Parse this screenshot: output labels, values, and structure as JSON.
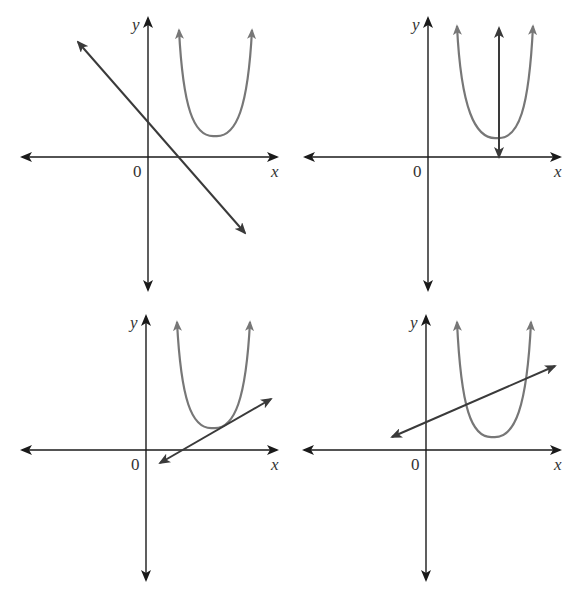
{
  "colors": {
    "axis": "#1a1a1a",
    "line": "#3a3a3a",
    "parabola": "#777777",
    "background": "#ffffff"
  },
  "panels": [
    {
      "id": "top-left",
      "description": "Line with negative slope; no intersection with parabola",
      "axis_labels": {
        "x": "x",
        "y": "y",
        "origin": "0"
      },
      "axes": {
        "ox": 148,
        "oy": 157,
        "x_from": 22,
        "x_to": 277,
        "y_from": 18,
        "y_to": 290
      },
      "parabola": {
        "vx": 215,
        "vy": 136,
        "arm_left_x": 179,
        "arm_right_x": 252,
        "arm_top_y": 30
      },
      "line": {
        "x1": 78,
        "y1": 42,
        "x2": 245,
        "y2": 233
      }
    },
    {
      "id": "top-right",
      "description": "Vertical line x = a passing through vertex region of parabola",
      "axis_labels": {
        "x": "x",
        "y": "y",
        "origin": "0"
      },
      "axes": {
        "ox": 428,
        "oy": 157,
        "x_from": 305,
        "x_to": 560,
        "y_from": 18,
        "y_to": 290
      },
      "parabola": {
        "vx": 497,
        "vy": 138,
        "arm_left_x": 457,
        "arm_right_x": 533,
        "arm_top_y": 26
      },
      "line": {
        "x1": 499,
        "y1": 28,
        "x2": 499,
        "y2": 157
      }
    },
    {
      "id": "bottom-left",
      "description": "Line tangent to parabola near its vertex",
      "axis_labels": {
        "x": "x",
        "y": "y",
        "origin": "0"
      },
      "axes": {
        "ox": 146,
        "oy": 450,
        "x_from": 22,
        "x_to": 277,
        "y_from": 316,
        "y_to": 580
      },
      "parabola": {
        "vx": 213,
        "vy": 428,
        "arm_left_x": 177,
        "arm_right_x": 250,
        "arm_top_y": 322
      },
      "line": {
        "x1": 160,
        "y1": 463,
        "x2": 271,
        "y2": 399
      }
    },
    {
      "id": "bottom-right",
      "description": "Line crossing parabola at two points",
      "axis_labels": {
        "x": "x",
        "y": "y",
        "origin": "0"
      },
      "axes": {
        "ox": 426,
        "oy": 450,
        "x_from": 304,
        "x_to": 560,
        "y_from": 316,
        "y_to": 580
      },
      "parabola": {
        "vx": 493,
        "vy": 437,
        "arm_left_x": 457,
        "arm_right_x": 531,
        "arm_top_y": 322
      },
      "line": {
        "x1": 392,
        "y1": 437,
        "x2": 555,
        "y2": 366
      }
    }
  ]
}
